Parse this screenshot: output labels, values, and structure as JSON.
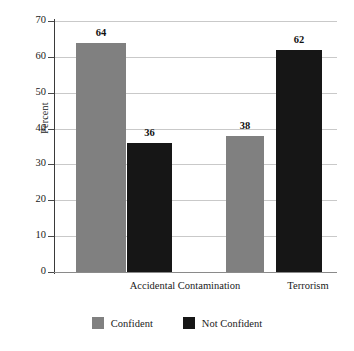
{
  "chart_data": {
    "type": "bar",
    "title": "",
    "xlabel": "",
    "ylabel": "Percent",
    "ylim": [
      0,
      70
    ],
    "yticks": [
      0,
      10,
      20,
      30,
      40,
      50,
      60,
      70
    ],
    "ytick_labels": [
      "0",
      "10",
      "20",
      "30",
      "40",
      "50",
      "60",
      "70"
    ],
    "grid": true,
    "legend_position": "bottom-center",
    "categories": [
      "Accidental Contamination",
      "Terrorism"
    ],
    "series": [
      {
        "name": "Confident",
        "color": "#808080",
        "values": [
          64,
          38
        ],
        "value_labels": [
          "64",
          "38"
        ]
      },
      {
        "name": "Not Confident",
        "color": "#161616",
        "values": [
          36,
          62
        ],
        "value_labels": [
          "36",
          "62"
        ]
      }
    ]
  },
  "axis": {
    "y_title": "Percent"
  },
  "legend": {
    "items": [
      {
        "label": "Confident",
        "swatch": "gray"
      },
      {
        "label": "Not Confident",
        "swatch": "black"
      }
    ]
  }
}
